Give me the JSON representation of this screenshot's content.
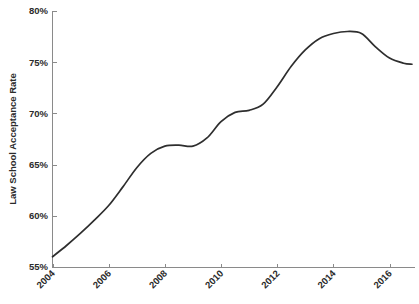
{
  "chart_data": {
    "type": "line",
    "title": "",
    "subtitle": "",
    "xlabel": "",
    "ylabel": "Law School Acceptance Rate",
    "xlim": [
      2004,
      2016.8
    ],
    "ylim": [
      55,
      80
    ],
    "grid": false,
    "legend": false,
    "legend_position": "none",
    "y_tick_labels": [
      "55%",
      "60%",
      "65%",
      "70%",
      "75%",
      "80%"
    ],
    "y_tick_values": [
      55,
      60,
      65,
      70,
      75,
      80
    ],
    "x_tick_labels": [
      "2004",
      "2006",
      "2008",
      "2010",
      "2012",
      "2014",
      "2016"
    ],
    "x_tick_values": [
      2004,
      2006,
      2008,
      2010,
      2012,
      2014,
      2016
    ],
    "series": [
      {
        "name": "Law School Acceptance Rate",
        "color": "#2e2e2e",
        "x": [
          2004,
          2004.5,
          2005,
          2005.5,
          2006,
          2006.5,
          2007,
          2007.5,
          2008,
          2008.5,
          2009,
          2009.5,
          2010,
          2010.5,
          2011,
          2011.5,
          2012,
          2012.5,
          2013,
          2013.5,
          2014,
          2014.5,
          2015,
          2015.5,
          2016,
          2016.5,
          2016.8
        ],
        "values": [
          56.0,
          57.1,
          58.3,
          59.6,
          61.0,
          62.8,
          64.7,
          66.1,
          66.8,
          66.9,
          66.8,
          67.6,
          69.2,
          70.1,
          70.3,
          70.9,
          72.6,
          74.6,
          76.2,
          77.3,
          77.8,
          78.0,
          77.8,
          76.5,
          75.4,
          74.9,
          74.8
        ]
      }
    ]
  },
  "axes": {
    "y_axis_label": "Law School Acceptance Rate",
    "y_ticks": [
      {
        "label": "80%",
        "value": 80
      },
      {
        "label": "75%",
        "value": 75
      },
      {
        "label": "70%",
        "value": 70
      },
      {
        "label": "65%",
        "value": 65
      },
      {
        "label": "60%",
        "value": 60
      },
      {
        "label": "55%",
        "value": 55
      }
    ],
    "x_ticks": [
      {
        "label": "2004",
        "value": 2004
      },
      {
        "label": "2006",
        "value": 2006
      },
      {
        "label": "2008",
        "value": 2008
      },
      {
        "label": "2010",
        "value": 2010
      },
      {
        "label": "2012",
        "value": 2012
      },
      {
        "label": "2014",
        "value": 2014
      },
      {
        "label": "2016",
        "value": 2016
      }
    ]
  },
  "colors": {
    "line": "#2e2e2e",
    "axis": "#8a8a8a",
    "text": "#2b2b2b",
    "background": "#ffffff"
  }
}
